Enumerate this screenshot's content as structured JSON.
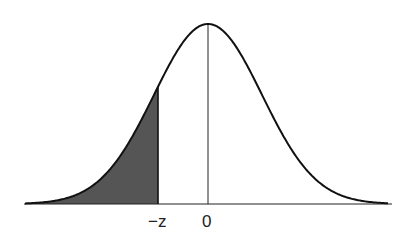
{
  "chart_data": {
    "type": "area",
    "title": "",
    "distribution": "standard normal",
    "xlabel": "",
    "ylabel": "",
    "tick_labels": [
      "−z",
      "0"
    ],
    "tick_positions": [
      -0.92,
      0
    ],
    "shaded_region": {
      "from": "-inf",
      "to": "-z",
      "color": "#555555"
    },
    "x_range": [
      -3.4,
      3.4
    ],
    "grid": false,
    "legend": null
  },
  "labels": {
    "neg_z": "−z",
    "zero": "0"
  },
  "colors": {
    "curve": "#111111",
    "shade": "#555555",
    "axis": "#222222"
  }
}
